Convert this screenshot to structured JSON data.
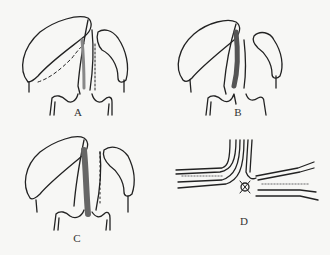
{
  "figure": {
    "panels": [
      {
        "id": "A",
        "label": "A",
        "description": "Two flaps with dotted incision lines, central shaded strip"
      },
      {
        "id": "B",
        "label": "B",
        "description": "Two flaps with central darkly shaded strip"
      },
      {
        "id": "C",
        "label": "C",
        "description": "Two flaps with central shaded strip and dotted line"
      },
      {
        "id": "D",
        "label": "D",
        "description": "Cross-section of layered tissue junction with suture"
      }
    ],
    "colors": {
      "line": "#222222",
      "shade": "#777777",
      "background": "#f7f7f5"
    }
  }
}
